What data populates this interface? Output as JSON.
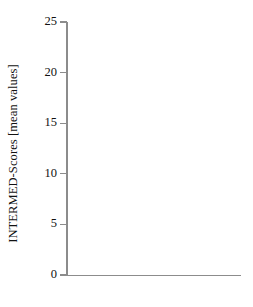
{
  "chart_data": {
    "type": "bar",
    "subtype": "stacked",
    "title": "",
    "xlabel": "",
    "ylabel": "INTERMED-Scores [mean values]",
    "categories": [
      "Cluster 1",
      "Cluster 2",
      "Cluster 3"
    ],
    "ylim": [
      0,
      25
    ],
    "yticks": [
      0,
      5,
      10,
      15,
      20,
      25
    ],
    "ytick_labels": [
      "0",
      "5",
      "10",
      "15",
      "20",
      "25"
    ],
    "grid": false,
    "legend": "none",
    "series": [
      {
        "name": "segment-1-gray",
        "color": "#878787",
        "values": [
          7.1,
          2.2,
          8.4
        ]
      },
      {
        "name": "segment-2-dark",
        "color": "#2b2b2b",
        "values": [
          3.5,
          2.5,
          7.6
        ]
      },
      {
        "name": "segment-3-white",
        "color": "#f2f2f2",
        "values": [
          0.6,
          0.6,
          4.0
        ]
      },
      {
        "name": "segment-4-black",
        "color": "#000000",
        "values": [
          1.5,
          1.0,
          2.5
        ]
      }
    ],
    "totals": [
      12.7,
      6.3,
      22.5
    ]
  },
  "axis": {
    "y_title": "INTERMED-Scores [mean values]",
    "ticks": [
      {
        "label": "25",
        "value": 25
      },
      {
        "label": "20",
        "value": 20
      },
      {
        "label": "15",
        "value": 15
      },
      {
        "label": "10",
        "value": 10
      },
      {
        "label": "5",
        "value": 5
      },
      {
        "label": "0",
        "value": 0
      }
    ]
  },
  "categories": [
    {
      "label": "Cluster 1"
    },
    {
      "label": "Cluster 2"
    },
    {
      "label": "Cluster 3"
    }
  ],
  "colors": {
    "axis": "#8c8c8c",
    "text": "#111111",
    "background": "#ffffff"
  }
}
